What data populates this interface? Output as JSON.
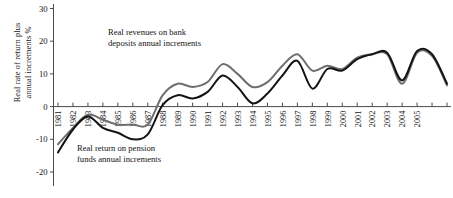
{
  "axes": {
    "ylabel": "Real rate of return plus\nannual increments %",
    "yticks": [
      30,
      20,
      10,
      0,
      -10,
      -20
    ],
    "ylim": [
      -22,
      31
    ],
    "xlabels": [
      "1981",
      "1982",
      "1983",
      "1984",
      "1985",
      "1986",
      "1987",
      "1988",
      "1989",
      "1990",
      "1991",
      "1992",
      "1993",
      "1994",
      "1995",
      "1996",
      "1997",
      "1998",
      "1999",
      "2000",
      "2001",
      "2002",
      "2003",
      "2004",
      "2005",
      "",
      ""
    ],
    "grid": false,
    "legend_position": "inline-annotations"
  },
  "annotations": {
    "deposits": "Real revenues on bank\ndeposits annual increments",
    "pension": "Real return on pension\nfunds annual increments"
  },
  "colors": {
    "deposits_line": "#6e6e6e",
    "pension_line": "#141414",
    "axis": "#4a4a4a",
    "text": "#141414"
  },
  "chart_data": {
    "type": "line",
    "title": "",
    "xlabel": "",
    "ylabel": "Real rate of return plus annual increments %",
    "ylim": [
      -22,
      31
    ],
    "yticks": [
      -20,
      -10,
      0,
      10,
      20,
      30
    ],
    "x": [
      1981,
      1982,
      1983,
      1984,
      1985,
      1986,
      1987,
      1988,
      1989,
      1990,
      1991,
      1992,
      1993,
      1994,
      1995,
      1996,
      1997,
      1998,
      1999,
      2000,
      2001,
      2002,
      2003,
      2004,
      2005,
      2006,
      2007
    ],
    "series": [
      {
        "name": "Real revenues on bank deposits annual increments",
        "color": "#6e6e6e",
        "values": [
          -11.5,
          -6.5,
          -2.5,
          -4.0,
          -5.5,
          -5.5,
          -5.5,
          3.5,
          7.0,
          6.0,
          7.5,
          13.0,
          10.0,
          6.0,
          7.5,
          12.5,
          16.0,
          11.0,
          12.5,
          11.5,
          15.0,
          16.0,
          16.0,
          7.0,
          16.5,
          15.5,
          6.5
        ]
      },
      {
        "name": "Real return on pension funds annual increments",
        "color": "#141414",
        "values": [
          -14.0,
          -7.0,
          -3.0,
          -6.5,
          -8.0,
          -10.0,
          -8.5,
          0.5,
          3.5,
          2.5,
          4.5,
          9.5,
          6.0,
          1.0,
          4.0,
          9.5,
          14.0,
          5.5,
          11.5,
          11.0,
          14.5,
          16.0,
          16.5,
          8.0,
          17.0,
          16.0,
          7.0
        ]
      }
    ]
  }
}
